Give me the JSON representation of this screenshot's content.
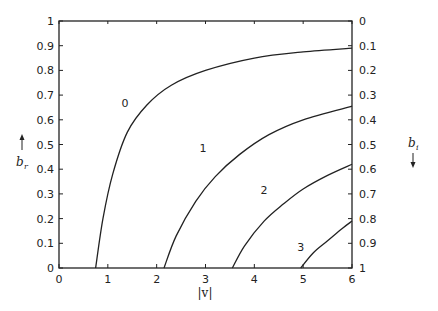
{
  "chart_data": {
    "type": "line",
    "title": "",
    "xlabel": "|v|",
    "ylabel_left": "b_r",
    "ylabel_right": "b_i",
    "xlim": [
      0,
      6
    ],
    "ylim_left": [
      0,
      1
    ],
    "ylim_right": [
      1,
      0
    ],
    "grid": false,
    "legend_position": "inline curve labels",
    "x_ticks": [
      "0",
      "1",
      "2",
      "3",
      "4",
      "5",
      "6"
    ],
    "y_ticks_left": [
      "0",
      "0.1",
      "0.2",
      "0.3",
      "0.4",
      "0.5",
      "0.6",
      "0.7",
      "0.8",
      "0.9",
      "1"
    ],
    "y_ticks_right": [
      "1",
      "0.9",
      "0.8",
      "0.7",
      "0.6",
      "0.5",
      "0.4",
      "0.3",
      "0.2",
      "0.1",
      "0"
    ],
    "series": [
      {
        "name": "0",
        "x": [
          0.75,
          0.9,
          1.1,
          1.4,
          1.8,
          2.3,
          3.0,
          4.0,
          5.0,
          6.0
        ],
        "y": [
          0.0,
          0.2,
          0.38,
          0.55,
          0.66,
          0.74,
          0.8,
          0.85,
          0.875,
          0.89
        ]
      },
      {
        "name": "1",
        "x": [
          2.15,
          2.4,
          2.8,
          3.2,
          3.7,
          4.3,
          5.0,
          6.0
        ],
        "y": [
          0.0,
          0.13,
          0.27,
          0.37,
          0.46,
          0.54,
          0.6,
          0.655
        ]
      },
      {
        "name": "2",
        "x": [
          3.55,
          3.8,
          4.2,
          4.6,
          5.0,
          5.5,
          6.0
        ],
        "y": [
          0.0,
          0.09,
          0.19,
          0.26,
          0.32,
          0.375,
          0.42
        ]
      },
      {
        "name": "3",
        "x": [
          4.95,
          5.2,
          5.5,
          5.8,
          6.0
        ],
        "y": [
          0.0,
          0.06,
          0.11,
          0.16,
          0.19
        ]
      }
    ],
    "curve_label_positions": [
      {
        "name": "0",
        "x": 1.35,
        "y": 0.65
      },
      {
        "name": "1",
        "x": 2.95,
        "y": 0.47
      },
      {
        "name": "2",
        "x": 4.2,
        "y": 0.3
      },
      {
        "name": "3",
        "x": 4.95,
        "y": 0.07
      }
    ]
  },
  "labels": {
    "x_axis": "|v|",
    "y_left": "b",
    "y_left_sub": "r",
    "y_right": "b",
    "y_right_sub": "i"
  }
}
